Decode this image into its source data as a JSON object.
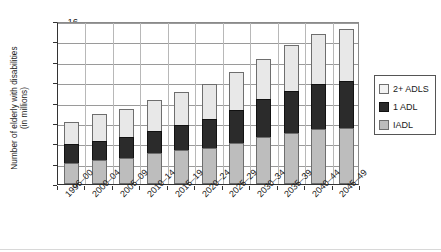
{
  "chart_data": {
    "type": "bar",
    "subtype": "stacked-vertical",
    "title": "",
    "xlabel": "",
    "ylabel": "Number of elderly with disabilities (in millions)",
    "ylabel_line1": "Number of elderly with disabilities",
    "ylabel_line2": "(in millions)",
    "ylim": [
      0,
      16
    ],
    "ytick_step": 2,
    "yticks": [
      "0",
      "2",
      "4",
      "6",
      "8",
      "10",
      "12",
      "14",
      "16"
    ],
    "grid": "horizontal-and-vertical",
    "legend_position": "right",
    "categories": [
      "1996–00",
      "2000–04",
      "2005–09",
      "2010–14",
      "2015–19",
      "2020–24",
      "2025–29",
      "2030–34",
      "2035–39",
      "2040–44",
      "2045–49"
    ],
    "series": [
      {
        "name": "IADL",
        "color": "#bdbdbd",
        "stack_order": 1,
        "values": [
          2.1,
          2.4,
          2.6,
          3.0,
          3.3,
          3.5,
          4.0,
          4.6,
          5.0,
          5.4,
          5.5
        ]
      },
      {
        "name": "1 ADL",
        "color": "#2b2b2b",
        "stack_order": 2,
        "values": [
          1.8,
          1.8,
          2.0,
          2.2,
          2.5,
          2.9,
          3.3,
          3.7,
          4.1,
          4.4,
          4.6
        ]
      },
      {
        "name": "2+ ADLS",
        "color": "#e8e8e8",
        "stack_order": 3,
        "values": [
          2.2,
          2.65,
          2.8,
          3.0,
          3.2,
          3.4,
          3.7,
          4.0,
          4.5,
          4.9,
          5.1
        ]
      }
    ],
    "totals": [
      6.1,
      6.85,
      7.4,
      8.2,
      9.0,
      9.8,
      11.0,
      12.3,
      13.6,
      14.7,
      15.2
    ]
  },
  "legend": {
    "entries": [
      {
        "label": "2+ ADLS",
        "swatch": "white-square-swatch",
        "color": "#f2f2f2"
      },
      {
        "label": "1 ADL",
        "swatch": "black-square-swatch",
        "color": "#2b2b2b"
      },
      {
        "label": "IADL",
        "swatch": "gray-square-swatch",
        "color": "#bdbdbd"
      }
    ]
  }
}
